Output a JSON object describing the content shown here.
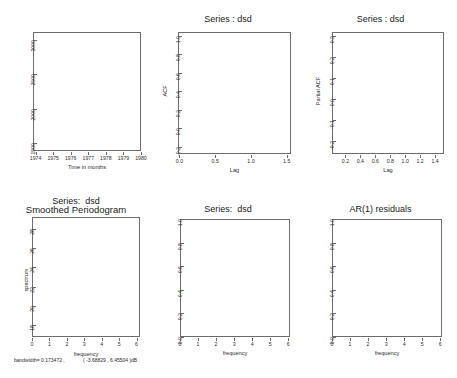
{
  "figure": {
    "kind": "r-graphics-device",
    "panels": 6,
    "background": "#ffffff",
    "line_color": "#111111",
    "ci_color": "#4a7fd4",
    "axis_color": "#6b6b6b"
  },
  "chart_data": [
    {
      "id": "timeseries",
      "type": "line",
      "title": "",
      "xlabel": "Time in months",
      "ylabel": "",
      "xticks": [
        "1974",
        "1975",
        "1976",
        "1977",
        "1978",
        "1979",
        "1980"
      ],
      "yticks": [
        "1500",
        "2000",
        "2500",
        "3000"
      ],
      "xlim": [
        1973.85,
        1980.0
      ],
      "ylim": [
        1380,
        3120
      ],
      "grid": false,
      "x": [
        1973.95,
        1974.03,
        1974.11,
        1974.19,
        1974.27,
        1974.35,
        1974.43,
        1974.51,
        1974.59,
        1974.67,
        1974.75,
        1974.83,
        1974.91,
        1974.99,
        1975.07,
        1975.15,
        1975.23,
        1975.31,
        1975.39,
        1975.47,
        1975.55,
        1975.63,
        1975.71,
        1975.79,
        1975.87,
        1975.95,
        1976.03,
        1976.11,
        1976.19,
        1976.27,
        1976.35,
        1976.43,
        1976.51,
        1976.59,
        1976.67,
        1976.75,
        1976.83,
        1976.91,
        1976.99,
        1977.07,
        1977.15,
        1977.23,
        1977.31,
        1977.39,
        1977.47,
        1977.55,
        1977.63,
        1977.71,
        1977.79,
        1977.87,
        1977.95,
        1978.03,
        1978.11,
        1978.19,
        1978.27,
        1978.35,
        1978.43,
        1978.51,
        1978.59,
        1978.67,
        1978.75,
        1978.83,
        1978.91,
        1978.99,
        1979.07,
        1979.15,
        1979.23,
        1979.31,
        1979.39,
        1979.47,
        1979.55,
        1979.63,
        1979.71,
        1979.79,
        1979.87,
        1979.95
      ],
      "values": [
        1700,
        1480,
        2050,
        2100,
        1950,
        2280,
        2160,
        2060,
        2180,
        2240,
        2120,
        2000,
        2180,
        2070,
        2140,
        2130,
        2080,
        2050,
        2170,
        2120,
        2180,
        2110,
        2220,
        2290,
        2090,
        2180,
        3090,
        2300,
        1920,
        1760,
        2060,
        1980,
        2040,
        2130,
        2260,
        2080,
        1890,
        1930,
        1980,
        1970,
        1950,
        1420,
        1980,
        1980,
        1960,
        1970,
        1960,
        1960,
        1900,
        1680,
        2140,
        2090,
        1830,
        1600,
        2070,
        2120,
        2070,
        2060,
        2090,
        2030,
        1560,
        2180,
        2120,
        1970,
        1860,
        1790,
        1960,
        1990,
        1960,
        1980,
        2000,
        1950,
        1940,
        1870,
        1780,
        1440
      ]
    },
    {
      "id": "acf",
      "type": "bar",
      "title": "Series : dsd",
      "xlabel": "Lag",
      "ylabel": "ACF",
      "xticks": [
        "0.0",
        "0.5",
        "1.0",
        "1.5"
      ],
      "yticks": [
        "-0.2",
        "0.0",
        "0.2",
        "0.4",
        "0.6",
        "0.8",
        "1.0"
      ],
      "xlim": [
        -0.02,
        1.56
      ],
      "ylim": [
        -0.28,
        1.04
      ],
      "grid": false,
      "confidence_bounds": [
        0.225,
        -0.225
      ],
      "lags": [
        0.0,
        0.04,
        0.08,
        0.13,
        0.17,
        0.21,
        0.25,
        0.29,
        0.33,
        0.38,
        0.42,
        0.46,
        0.5,
        0.54,
        0.58,
        0.63,
        0.67,
        0.71,
        0.75,
        0.79,
        0.83,
        0.88,
        0.92,
        0.96,
        1.0,
        1.04,
        1.08,
        1.13,
        1.17,
        1.21,
        1.25,
        1.29,
        1.33,
        1.38,
        1.42,
        1.46,
        1.5
      ],
      "values": [
        1.0,
        0.26,
        0.005,
        -0.01,
        0.1,
        0.18,
        0.07,
        0.12,
        0.13,
        0.09,
        0.12,
        0.13,
        0.07,
        0.13,
        0.11,
        0.33,
        0.09,
        0.0,
        -0.13,
        0.09,
        0.04,
        0.11,
        0.07,
        0.06,
        0.1,
        0.04,
        0.11,
        0.04,
        0.06,
        0.0,
        0.05,
        0.03,
        0.04,
        0.02,
        0.03,
        0.01,
        0.02
      ]
    },
    {
      "id": "pacf",
      "type": "bar",
      "title": "Series : dsd",
      "xlabel": "Lag",
      "ylabel": "Partial ACF",
      "xticks": [
        "0.2",
        "0.4",
        "0.6",
        "0.8",
        "1.0",
        "1.2",
        "1.4"
      ],
      "yticks": [
        "-0.2",
        "-0.1",
        "0.0",
        "0.1",
        "0.2",
        "0.3"
      ],
      "xlim": [
        0.02,
        1.52
      ],
      "ylim": [
        -0.26,
        0.32
      ],
      "grid": false,
      "confidence_bounds": [
        0.225,
        -0.225
      ],
      "lags": [
        0.04,
        0.08,
        0.13,
        0.17,
        0.21,
        0.25,
        0.29,
        0.33,
        0.38,
        0.42,
        0.46,
        0.5,
        0.54,
        0.58,
        0.63,
        0.67,
        0.71,
        0.75,
        0.79,
        0.83,
        0.88,
        0.92,
        0.96,
        1.0,
        1.04,
        1.08,
        1.13,
        1.17,
        1.21,
        1.25,
        1.29,
        1.33,
        1.38,
        1.42,
        1.46
      ],
      "values": [
        0.27,
        -0.11,
        0.005,
        0.19,
        0.055,
        0.1,
        0.075,
        0.11,
        0.045,
        0.065,
        0.055,
        0.055,
        0.09,
        0.11,
        0.3,
        0.035,
        -0.055,
        -0.215,
        0.12,
        0.04,
        -0.07,
        0.025,
        0.035,
        0.03,
        0.1,
        0.025,
        -0.015,
        0.02,
        0.015,
        0.01,
        0.02,
        0.01,
        0.015,
        0.005,
        0.01
      ]
    },
    {
      "id": "spectrum",
      "type": "line",
      "title": "Series:  dsd",
      "subtitle": "Smoothed Periodogram",
      "xlabel": "frequency",
      "ylabel": "spectrum",
      "footnote": "bandwidth= 0.173472 , 95% C.I. is ( -3.68829 , 6.45504 )dB",
      "footnote_left": "bandwidth= 0.173472 ,",
      "footnote_right": "( -3.68829 , 6.45504 )dB",
      "xticks": [
        "0",
        "1",
        "2",
        "3",
        "4",
        "5",
        "6"
      ],
      "yticks": [
        "18",
        "20",
        "22",
        "24",
        "26",
        "28"
      ],
      "xlim": [
        0.0,
        6.2
      ],
      "ylim": [
        16.8,
        29.2
      ],
      "grid": false,
      "x": [
        0.05,
        0.2,
        0.38,
        0.52,
        0.62,
        0.72,
        0.85,
        0.98,
        1.1,
        1.22,
        1.32,
        1.42,
        1.52,
        1.62,
        1.75,
        1.88,
        2.0,
        2.1,
        2.2,
        2.32,
        2.45,
        2.58,
        2.7,
        2.82,
        2.95,
        3.08,
        3.2,
        3.32,
        3.45,
        3.58,
        3.7,
        3.82,
        3.95,
        4.08,
        4.2,
        4.32,
        4.45,
        4.58,
        4.7,
        4.82,
        4.95,
        5.08,
        5.2,
        5.35,
        5.5,
        5.62,
        5.75,
        5.88,
        6.0,
        6.1
      ],
      "values": [
        21.6,
        22.0,
        23.2,
        22.6,
        22.8,
        23.6,
        24.4,
        25.6,
        26.5,
        27.3,
        27.6,
        27.5,
        26.6,
        24.8,
        23.2,
        22.6,
        22.8,
        24.8,
        26.6,
        27.8,
        28.5,
        28.4,
        27.3,
        25.6,
        24.4,
        25.2,
        26.6,
        27.8,
        28.4,
        28.5,
        27.9,
        26.8,
        25.4,
        24.0,
        22.6,
        21.4,
        20.6,
        21.9,
        23.4,
        24.1,
        23.2,
        21.6,
        20.0,
        18.6,
        17.9,
        19.6,
        21.2,
        21.7,
        20.9,
        19.9
      ],
      "ci_marker": {
        "x": 5.55,
        "low": 17.6,
        "high": 28.6,
        "center": 21.9
      }
    },
    {
      "id": "cpgram_dsd",
      "type": "line",
      "title": "Series:  dsd",
      "xlabel": "frequency",
      "ylabel": "",
      "xticks": [
        "0",
        "1",
        "2",
        "3",
        "4",
        "5",
        "6"
      ],
      "yticks": [
        "0.0",
        "0.2",
        "0.4",
        "0.6",
        "0.8",
        "1.0"
      ],
      "xlim": [
        0.0,
        6.1
      ],
      "ylim": [
        0.0,
        1.0
      ],
      "grid": false,
      "bounds": [
        {
          "name": "upper",
          "x": [
            0.0,
            4.62
          ],
          "y": [
            0.215,
            1.0
          ]
        },
        {
          "name": "lower",
          "x": [
            1.35,
            6.1
          ],
          "y": [
            0.0,
            0.785
          ]
        }
      ],
      "x": [
        0.12,
        0.12,
        0.25,
        0.38,
        0.5,
        0.62,
        0.75,
        0.88,
        1.0,
        1.12,
        1.25,
        1.38,
        1.5,
        1.62,
        1.75,
        1.88,
        2.0,
        2.12,
        2.25,
        2.38,
        2.5,
        2.62,
        2.75,
        2.88,
        3.0,
        3.12,
        3.25,
        3.38,
        3.5,
        3.62,
        3.75,
        3.88,
        4.0,
        4.12,
        4.25,
        4.38,
        4.5,
        4.62,
        4.75,
        4.88,
        5.0,
        5.25,
        5.5,
        5.75,
        6.0
      ],
      "values": [
        0.0,
        0.185,
        0.195,
        0.205,
        0.215,
        0.245,
        0.265,
        0.285,
        0.3,
        0.315,
        0.335,
        0.355,
        0.395,
        0.425,
        0.435,
        0.44,
        0.455,
        0.465,
        0.485,
        0.52,
        0.555,
        0.585,
        0.6,
        0.625,
        0.665,
        0.695,
        0.715,
        0.745,
        0.775,
        0.835,
        0.845,
        0.86,
        0.865,
        0.875,
        0.885,
        0.895,
        0.915,
        0.935,
        0.945,
        0.955,
        0.96,
        0.97,
        0.98,
        0.99,
        1.0
      ]
    },
    {
      "id": "cpgram_ar1",
      "type": "line",
      "title": "AR(1) residuals",
      "xlabel": "frequency",
      "ylabel": "",
      "xticks": [
        "0",
        "1",
        "2",
        "3",
        "4",
        "5",
        "6"
      ],
      "yticks": [
        "0.0",
        "0.2",
        "0.4",
        "0.6",
        "0.8",
        "1.0"
      ],
      "xlim": [
        0.0,
        6.1
      ],
      "ylim": [
        0.0,
        1.0
      ],
      "grid": false,
      "bounds": [
        {
          "name": "upper",
          "x": [
            0.0,
            4.62
          ],
          "y": [
            0.215,
            1.0
          ]
        },
        {
          "name": "lower",
          "x": [
            1.35,
            6.1
          ],
          "y": [
            0.0,
            0.785
          ]
        }
      ],
      "x": [
        0.12,
        0.12,
        0.25,
        0.4,
        0.55,
        0.7,
        0.85,
        1.0,
        1.15,
        1.3,
        1.45,
        1.6,
        1.75,
        1.9,
        2.05,
        2.2,
        2.35,
        2.5,
        2.62,
        2.75,
        2.88,
        3.0,
        3.12,
        3.25,
        3.38,
        3.45,
        3.55,
        3.62,
        3.75,
        3.88,
        4.0,
        4.12,
        4.25,
        4.38,
        4.5,
        4.62,
        4.75,
        4.88,
        5.0,
        5.25,
        5.5,
        5.75,
        6.0
      ],
      "values": [
        0.0,
        0.105,
        0.11,
        0.115,
        0.125,
        0.13,
        0.145,
        0.155,
        0.17,
        0.195,
        0.205,
        0.215,
        0.245,
        0.265,
        0.275,
        0.285,
        0.295,
        0.315,
        0.395,
        0.425,
        0.455,
        0.495,
        0.545,
        0.585,
        0.615,
        0.695,
        0.725,
        0.745,
        0.765,
        0.775,
        0.785,
        0.8,
        0.825,
        0.855,
        0.875,
        0.895,
        0.915,
        0.945,
        0.955,
        0.965,
        0.975,
        0.985,
        1.0
      ]
    }
  ]
}
